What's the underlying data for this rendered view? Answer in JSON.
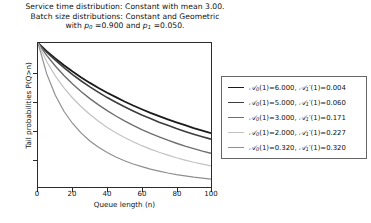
{
  "figure": {
    "title_lines": [
      "Service time distribution: Constant with mean 3.00.",
      "Batch size distributions: Constant and Geometric",
      "with p0 =0.900 and p1 =0.050."
    ],
    "title_line_1": "Service time distribution: Constant with mean 3.00.",
    "title_line_2": "Batch size distributions: Constant and Geometric",
    "title_line_3_pre": "with ",
    "title_line_3_p0": "p",
    "title_line_3_p0_sub": "0",
    "title_line_3_mid": " =0.900 and ",
    "title_line_3_p1": "p",
    "title_line_3_p1_sub": "1",
    "title_line_3_post": " =0.050."
  },
  "axes": {
    "xlabel": "Queue length (n)",
    "ylabel": "Tail probabilities P(Q>n)",
    "xticks": [
      "0",
      "20",
      "40",
      "60",
      "80",
      "100"
    ],
    "yticks": [
      "0.2",
      "0.4",
      "0.6",
      "0.8"
    ]
  },
  "legend": {
    "entries": [
      {
        "label": "A0(1)=6.000, A1'(1)=0.004",
        "a0": "6.000",
        "a1": "0.004",
        "color": "#1a1a1a"
      },
      {
        "label": "A0(1)=5.000, A1'(1)=0.060",
        "a0": "5.000",
        "a1": "0.060",
        "color": "#3d3d3d"
      },
      {
        "label": "A0(1)=3.000, A1'(1)=0.171",
        "a0": "3.000",
        "a1": "0.171",
        "color": "#6e6e6e"
      },
      {
        "label": "A0(1)=2.000, A1'(1)=0.227",
        "a0": "2.000",
        "a1": "0.227",
        "color": "#c2c2c2"
      },
      {
        "label": "A0(1)=0.320, A1'(1)=0.320",
        "a0": "0.320",
        "a1": "0.320",
        "color": "#8f8f8f"
      }
    ]
  },
  "chart_data": {
    "type": "line",
    "xlabel": "Queue length (n)",
    "ylabel": "Tail probabilities P(Q>n)",
    "xlim": [
      0,
      100
    ],
    "ylim": [
      0.0,
      1.0
    ],
    "xticks": [
      0,
      20,
      40,
      60,
      80,
      100
    ],
    "yticks": [
      0.2,
      0.4,
      0.6,
      0.8
    ],
    "grid": false,
    "legend_position": "right-outside",
    "x": [
      0,
      5,
      10,
      15,
      20,
      25,
      30,
      35,
      40,
      45,
      50,
      55,
      60,
      65,
      70,
      75,
      80,
      85,
      90,
      95,
      100
    ],
    "series": [
      {
        "name": "A0(1)=6.000, A1'(1)=0.004",
        "a0": 6.0,
        "a1_prime": 0.004,
        "color": "#1a1a1a",
        "values": [
          1.0,
          0.944,
          0.893,
          0.846,
          0.802,
          0.761,
          0.723,
          0.688,
          0.655,
          0.624,
          0.594,
          0.566,
          0.54,
          0.515,
          0.492,
          0.47,
          0.449,
          0.429,
          0.409,
          0.391,
          0.374
        ]
      },
      {
        "name": "A0(1)=5.000, A1'(1)=0.060",
        "a0": 5.0,
        "a1_prime": 0.06,
        "color": "#3d3d3d",
        "values": [
          1.0,
          0.937,
          0.881,
          0.829,
          0.781,
          0.736,
          0.695,
          0.657,
          0.621,
          0.588,
          0.557,
          0.528,
          0.5,
          0.475,
          0.45,
          0.428,
          0.406,
          0.386,
          0.367,
          0.349,
          0.332
        ]
      },
      {
        "name": "A0(1)=3.000, A1'(1)=0.171",
        "a0": 3.0,
        "a1_prime": 0.171,
        "color": "#6e6e6e",
        "values": [
          1.0,
          0.914,
          0.84,
          0.774,
          0.715,
          0.662,
          0.614,
          0.57,
          0.53,
          0.493,
          0.459,
          0.428,
          0.399,
          0.372,
          0.348,
          0.325,
          0.304,
          0.284,
          0.266,
          0.249,
          0.234
        ]
      },
      {
        "name": "A0(1)=2.000, A1'(1)=0.227",
        "a0": 2.0,
        "a1_prime": 0.227,
        "color": "#c2c2c2",
        "values": [
          1.0,
          0.872,
          0.772,
          0.689,
          0.618,
          0.557,
          0.503,
          0.456,
          0.414,
          0.377,
          0.344,
          0.314,
          0.287,
          0.263,
          0.241,
          0.221,
          0.203,
          0.187,
          0.172,
          0.159,
          0.147
        ]
      },
      {
        "name": "A0(1)=0.320, A1'(1)=0.320",
        "a0": 0.32,
        "a1_prime": 0.32,
        "color": "#8f8f8f",
        "values": [
          1.0,
          0.787,
          0.637,
          0.526,
          0.441,
          0.374,
          0.32,
          0.276,
          0.239,
          0.208,
          0.182,
          0.16,
          0.141,
          0.124,
          0.11,
          0.097,
          0.086,
          0.077,
          0.068,
          0.061,
          0.054
        ]
      }
    ]
  }
}
